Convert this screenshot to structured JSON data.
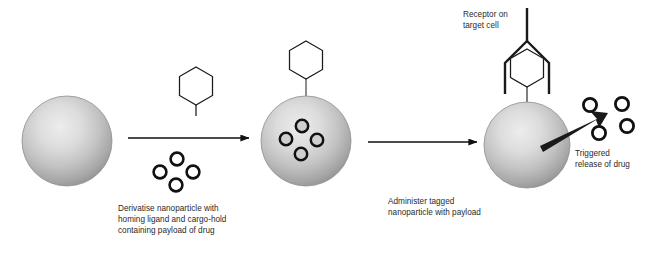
{
  "figure": {
    "background_color": "#ffffff",
    "width": 658,
    "height": 253
  },
  "captions": {
    "step1": "Derivatise nanoparticle with\nhoming ligand and cargo-hold\ncontaining payload of drug",
    "step2": "Administer tagged\nnanoparticle with payload",
    "receptor": "Receptor on\ntarget cell",
    "release": "Triggered\nrelease of drug"
  },
  "colors": {
    "text": "#2a2a2a",
    "stroke": "#1a1a1a",
    "sphere_light": "#e8e8e8",
    "sphere_mid": "#b8b8b8",
    "sphere_dark": "#8a8a8a",
    "sphere_edge": "#7d7d7d",
    "arrow": "#111111",
    "release_arrow": "#1a1a1a"
  },
  "stages": [
    {
      "id": "bare-nanoparticle",
      "label": "Bare nanoparticle",
      "sphere": {
        "cx": 67,
        "cy": 141,
        "r": 45
      },
      "ligand": null,
      "cargo_count": 0
    },
    {
      "id": "tagged-nanoparticle",
      "label": "Tagged nanoparticle with payload",
      "sphere": {
        "cx": 306,
        "cy": 141,
        "r": 45
      },
      "ligand": {
        "type": "hexagon",
        "cx": 306,
        "cy": 60,
        "r": 19
      },
      "cargo_count": 4
    },
    {
      "id": "bound-nanoparticle",
      "label": "Nanoparticle bound to receptor releasing drug",
      "sphere": {
        "cx": 527,
        "cy": 145,
        "r": 43
      },
      "ligand": {
        "type": "hexagon",
        "cx": 527,
        "cy": 68,
        "r": 19
      },
      "receptor": {
        "type": "funnel-with-stem",
        "stem_top_y": 8
      },
      "cargo_count": 0,
      "released_count": 4
    }
  ],
  "reagents": {
    "ligand": {
      "type": "hexagon",
      "label": "Homing ligand",
      "cx": 196,
      "cy": 86,
      "r": 19
    },
    "payload": {
      "type": "drug-circles",
      "label": "Drug payload",
      "count": 4
    }
  },
  "arrows": [
    {
      "id": "arrow-step-1",
      "from_stage": "bare-nanoparticle",
      "to_stage": "tagged-nanoparticle",
      "x1": 128,
      "y1": 138,
      "x2": 250,
      "y2": 138
    },
    {
      "id": "arrow-step-2",
      "from_stage": "tagged-nanoparticle",
      "to_stage": "bound-nanoparticle",
      "x1": 368,
      "y1": 142,
      "x2": 478,
      "y2": 142
    },
    {
      "id": "arrow-release",
      "from_stage": "bound-nanoparticle",
      "to_stage": "released-drug",
      "x1": 542,
      "y1": 141,
      "x2": 602,
      "y2": 116
    }
  ]
}
